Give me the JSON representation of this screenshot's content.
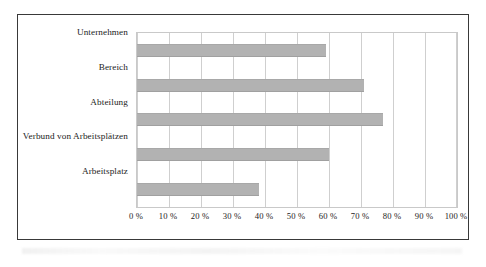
{
  "chart_data": {
    "type": "bar",
    "orientation": "horizontal",
    "title": "",
    "subtitle": "",
    "xlabel": "",
    "ylabel": "",
    "categories": [
      "Unternehmen",
      "Bereich",
      "Abteilung",
      "Verbund von Arbeitsplätzen",
      "Arbeitsplatz"
    ],
    "values": [
      59,
      71,
      77,
      60,
      38
    ],
    "xlim": [
      0,
      100
    ],
    "xticks": [
      0,
      10,
      20,
      30,
      40,
      50,
      60,
      70,
      80,
      90,
      100
    ],
    "xtick_labels": [
      "0 %",
      "10 %",
      "20 %",
      "30 %",
      "40 %",
      "50 %",
      "60 %",
      "70 %",
      "80 %",
      "90 %",
      "100 %"
    ],
    "grid": "vertical",
    "legend": "none",
    "unit": "%",
    "bar_color": "#b2b2b2",
    "gridline_color": "#cfcfcf",
    "frame_color": "#4a4a4a",
    "text_color": "#1c1c1c"
  }
}
